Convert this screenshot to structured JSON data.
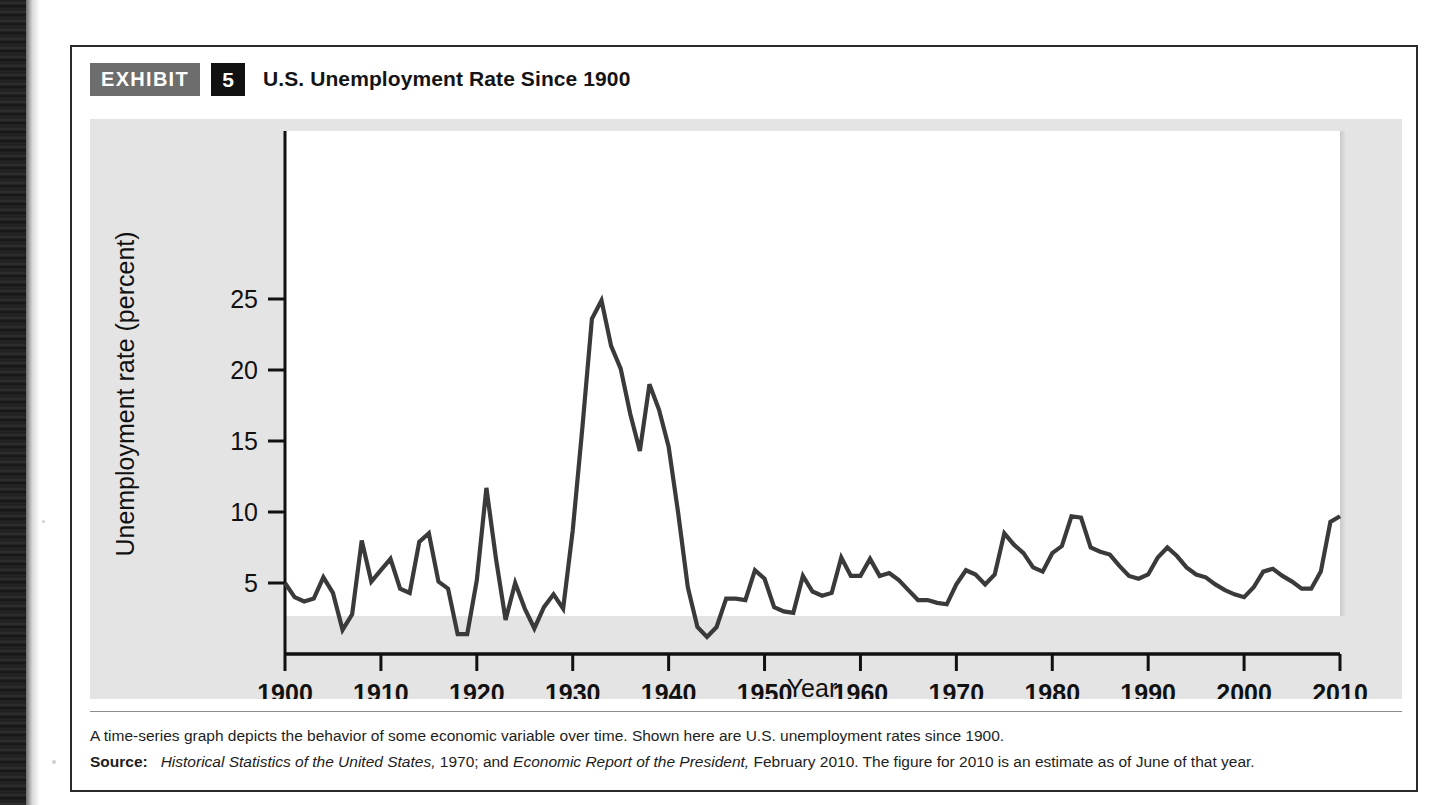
{
  "header": {
    "tag": "EXHIBIT",
    "number": "5",
    "title": "U.S. Unemployment Rate Since 1900"
  },
  "caption": {
    "description": "A time-series graph depicts the behavior of some economic variable over time. Shown here are U.S. unemployment rates since 1900.",
    "source_label": "Source:",
    "source_part1_italic": "Historical Statistics of the United States,",
    "source_part2": " 1970; and ",
    "source_part3_italic": "Economic Report of the President,",
    "source_part4": " February 2010. The figure for 2010 is an estimate as of June of that year."
  },
  "colors": {
    "tag_background": "#6d6d6d",
    "number_background": "#111111",
    "panel_background": "#e4e4e4",
    "plot_background": "#ffffff",
    "line_color": "#3a3a3a",
    "axis_color": "#111111",
    "box_border": "#2b2b2b"
  },
  "chart_data": {
    "type": "line",
    "title": "U.S. Unemployment Rate Since 1900",
    "xlabel": "Year",
    "ylabel": "Unemployment rate (percent)",
    "xlim": [
      1900,
      2010
    ],
    "ylim": [
      0,
      28
    ],
    "grid": false,
    "legend": "none",
    "xticks": [
      1900,
      1910,
      1920,
      1930,
      1940,
      1950,
      1960,
      1970,
      1980,
      1990,
      2000,
      2010
    ],
    "xtick_labels": [
      "1900",
      "1910",
      "1920",
      "1930",
      "1940",
      "1950",
      "1960",
      "1970",
      "1980",
      "1990",
      "2000",
      "2010"
    ],
    "yticks": [
      5,
      10,
      15,
      20,
      25
    ],
    "ytick_labels": [
      "5",
      "10",
      "15",
      "20",
      "25"
    ],
    "x": [
      1900,
      1901,
      1902,
      1903,
      1904,
      1905,
      1906,
      1907,
      1908,
      1909,
      1910,
      1911,
      1912,
      1913,
      1914,
      1915,
      1916,
      1917,
      1918,
      1919,
      1920,
      1921,
      1922,
      1923,
      1924,
      1925,
      1926,
      1927,
      1928,
      1929,
      1930,
      1931,
      1932,
      1933,
      1934,
      1935,
      1936,
      1937,
      1938,
      1939,
      1940,
      1941,
      1942,
      1943,
      1944,
      1945,
      1946,
      1947,
      1948,
      1949,
      1950,
      1951,
      1952,
      1953,
      1954,
      1955,
      1956,
      1957,
      1958,
      1959,
      1960,
      1961,
      1962,
      1963,
      1964,
      1965,
      1966,
      1967,
      1968,
      1969,
      1970,
      1971,
      1972,
      1973,
      1974,
      1975,
      1976,
      1977,
      1978,
      1979,
      1980,
      1981,
      1982,
      1983,
      1984,
      1985,
      1986,
      1987,
      1988,
      1989,
      1990,
      1991,
      1992,
      1993,
      1994,
      1995,
      1996,
      1997,
      1998,
      1999,
      2000,
      2001,
      2002,
      2003,
      2004,
      2005,
      2006,
      2007,
      2008,
      2009,
      2010
    ],
    "values": [
      5.0,
      4.0,
      3.7,
      3.9,
      5.4,
      4.3,
      1.7,
      2.8,
      8.0,
      5.1,
      5.9,
      6.7,
      4.6,
      4.3,
      7.9,
      8.5,
      5.1,
      4.6,
      1.4,
      1.4,
      5.2,
      11.7,
      6.7,
      2.4,
      5.0,
      3.2,
      1.8,
      3.3,
      4.2,
      3.2,
      8.7,
      15.9,
      23.6,
      24.9,
      21.7,
      20.1,
      16.9,
      14.3,
      19.0,
      17.2,
      14.6,
      9.9,
      4.7,
      1.9,
      1.2,
      1.9,
      3.9,
      3.9,
      3.8,
      5.9,
      5.3,
      3.3,
      3.0,
      2.9,
      5.5,
      4.4,
      4.1,
      4.3,
      6.8,
      5.5,
      5.5,
      6.7,
      5.5,
      5.7,
      5.2,
      4.5,
      3.8,
      3.8,
      3.6,
      3.5,
      4.9,
      5.9,
      5.6,
      4.9,
      5.6,
      8.5,
      7.7,
      7.1,
      6.1,
      5.8,
      7.1,
      7.6,
      9.7,
      9.6,
      7.5,
      7.2,
      7.0,
      6.2,
      5.5,
      5.3,
      5.6,
      6.8,
      7.5,
      6.9,
      6.1,
      5.6,
      5.4,
      4.9,
      4.5,
      4.2,
      4.0,
      4.7,
      5.8,
      6.0,
      5.5,
      5.1,
      4.6,
      4.6,
      5.8,
      9.3,
      9.7
    ]
  }
}
